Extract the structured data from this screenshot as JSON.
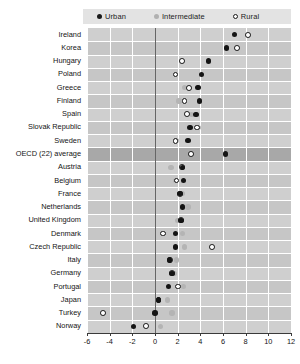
{
  "legend": {
    "items": [
      {
        "key": "urban",
        "label": "Urban",
        "marker": "filled-dot",
        "color": "#141414"
      },
      {
        "key": "intermediate",
        "label": "Intermediate",
        "marker": "grey-dot",
        "color": "#b4b4b4"
      },
      {
        "key": "rural",
        "label": "Rural",
        "marker": "open-dot",
        "color": "#ffffff"
      }
    ]
  },
  "chart_data": {
    "type": "scatter",
    "title": "",
    "xlabel": "",
    "ylabel": "",
    "xlim": [
      -6,
      12
    ],
    "xticks": [
      -6,
      -4,
      -2,
      0,
      2,
      4,
      6,
      8,
      10,
      12
    ],
    "xticklabels": [
      "-6",
      "-4",
      "-2",
      "0",
      "2",
      "4",
      "6",
      "8",
      "10",
      "12"
    ],
    "grid": true,
    "legend_position": "top",
    "zero_reference_line": 0,
    "highlight_category": "OECD (22) average",
    "categories": [
      "Ireland",
      "Korea",
      "Hungary",
      "Poland",
      "Greece",
      "Finland",
      "Spain",
      "Slovak Republic",
      "Sweden",
      "OECD (22) average",
      "Austria",
      "Belgium",
      "France",
      "Netherlands",
      "United Kingdom",
      "Denmark",
      "Czech Republic",
      "Italy",
      "Germany",
      "Portugal",
      "Japan",
      "Turkey",
      "Norway"
    ],
    "series": [
      {
        "name": "Urban",
        "marker": "filled-dot",
        "color": "#141414",
        "values": [
          7.0,
          6.3,
          4.7,
          4.1,
          3.8,
          3.9,
          3.6,
          3.1,
          2.9,
          6.2,
          2.4,
          2.5,
          2.2,
          2.4,
          2.3,
          1.8,
          1.8,
          1.3,
          1.5,
          1.2,
          0.3,
          0.0,
          -1.9
        ]
      },
      {
        "name": "Intermediate",
        "marker": "grey-dot",
        "color": "#b4b4b4",
        "values": [
          null,
          null,
          null,
          null,
          2.6,
          2.1,
          3.2,
          3.8,
          1.9,
          null,
          1.4,
          1.8,
          2.4,
          2.9,
          2.0,
          2.4,
          2.6,
          1.9,
          1.7,
          2.5,
          1.1,
          1.5,
          0.5
        ]
      },
      {
        "name": "Rural",
        "marker": "open-dot",
        "color": "#ffffff",
        "values": [
          8.2,
          7.2,
          2.4,
          1.8,
          3.0,
          2.6,
          2.8,
          3.7,
          1.8,
          3.2,
          2.4,
          1.9,
          2.2,
          null,
          2.3,
          0.7,
          5.0,
          1.3,
          1.5,
          2.0,
          0.3,
          -4.6,
          -0.8
        ]
      }
    ]
  }
}
